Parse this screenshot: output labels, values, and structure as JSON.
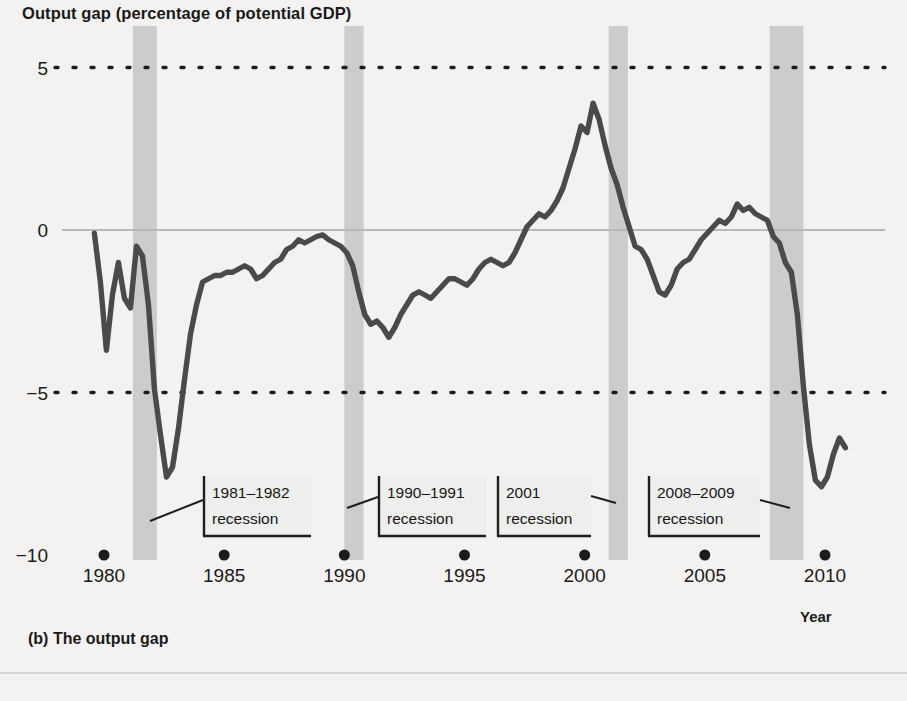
{
  "figure": {
    "title": "Output gap (percentage of potential GDP)",
    "caption": "(b) The output gap",
    "xaxis_label": "Year",
    "background_color": "#f3f2f0",
    "line_color": "#4a4a4a",
    "band_color": "#cccccc",
    "zero_line_color": "#b9b9b9",
    "grid_color": "#1b1b1b"
  },
  "chart_data": {
    "type": "line",
    "title": "Output gap (percentage of potential GDP)",
    "xlabel": "Year",
    "ylabel": "Output gap (percentage of potential GDP)",
    "xlim": [
      1979.4,
      2011.4
    ],
    "ylim": [
      -10,
      6.2
    ],
    "xticks": [
      1980,
      1985,
      1990,
      1995,
      2000,
      2005,
      2010
    ],
    "xtick_labels": [
      "1980",
      "1985",
      "1990",
      "1995",
      "2000",
      "2005",
      "2010"
    ],
    "yticks": [
      5,
      0,
      -5,
      -10
    ],
    "ytick_labels": [
      "5",
      "0",
      "−5",
      "−10"
    ],
    "grid": "dotted horizontal at 5 and -5; solid zero line at 0",
    "legend": "none",
    "series": [
      {
        "name": "Output gap",
        "color": "#4a4a4a",
        "x": [
          1979.6,
          1979.85,
          1980.1,
          1980.35,
          1980.6,
          1980.85,
          1981.1,
          1981.35,
          1981.6,
          1981.85,
          1982.1,
          1982.35,
          1982.6,
          1982.85,
          1983.1,
          1983.35,
          1983.6,
          1983.85,
          1984.1,
          1984.35,
          1984.6,
          1984.85,
          1985.1,
          1985.35,
          1985.6,
          1985.85,
          1986.1,
          1986.35,
          1986.6,
          1986.85,
          1987.1,
          1987.35,
          1987.6,
          1987.85,
          1988.1,
          1988.35,
          1988.6,
          1988.85,
          1989.1,
          1989.35,
          1989.6,
          1989.85,
          1990.1,
          1990.35,
          1990.6,
          1990.85,
          1991.1,
          1991.35,
          1991.6,
          1991.85,
          1992.1,
          1992.35,
          1992.6,
          1992.85,
          1993.1,
          1993.35,
          1993.6,
          1993.85,
          1994.1,
          1994.35,
          1994.6,
          1994.85,
          1995.1,
          1995.35,
          1995.6,
          1995.85,
          1996.1,
          1996.35,
          1996.6,
          1996.85,
          1997.1,
          1997.35,
          1997.6,
          1997.85,
          1998.1,
          1998.35,
          1998.6,
          1998.85,
          1999.1,
          1999.35,
          1999.6,
          1999.85,
          2000.1,
          2000.35,
          2000.6,
          2000.85,
          2001.1,
          2001.35,
          2001.6,
          2001.85,
          2002.1,
          2002.35,
          2002.6,
          2002.85,
          2003.1,
          2003.35,
          2003.6,
          2003.85,
          2004.1,
          2004.35,
          2004.6,
          2004.85,
          2005.1,
          2005.35,
          2005.6,
          2005.85,
          2006.1,
          2006.35,
          2006.6,
          2006.85,
          2007.1,
          2007.35,
          2007.6,
          2007.85,
          2008.1,
          2008.35,
          2008.6,
          2008.85,
          2009.1,
          2009.35,
          2009.6,
          2009.85,
          2010.1,
          2010.35,
          2010.6,
          2010.85
        ],
        "y": [
          -0.1,
          -1.6,
          -3.7,
          -2.0,
          -1.0,
          -2.1,
          -2.4,
          -0.5,
          -0.8,
          -2.3,
          -4.9,
          -6.3,
          -7.6,
          -7.3,
          -6.1,
          -4.6,
          -3.2,
          -2.3,
          -1.6,
          -1.5,
          -1.4,
          -1.4,
          -1.3,
          -1.3,
          -1.2,
          -1.1,
          -1.2,
          -1.5,
          -1.4,
          -1.2,
          -1.0,
          -0.9,
          -0.6,
          -0.5,
          -0.3,
          -0.4,
          -0.3,
          -0.2,
          -0.15,
          -0.3,
          -0.4,
          -0.5,
          -0.7,
          -1.1,
          -1.9,
          -2.6,
          -2.9,
          -2.8,
          -3.0,
          -3.3,
          -3.0,
          -2.6,
          -2.3,
          -2.0,
          -1.9,
          -2.0,
          -2.1,
          -1.9,
          -1.7,
          -1.5,
          -1.5,
          -1.6,
          -1.7,
          -1.5,
          -1.2,
          -1.0,
          -0.9,
          -1.0,
          -1.1,
          -1.0,
          -0.7,
          -0.3,
          0.1,
          0.3,
          0.5,
          0.4,
          0.6,
          0.9,
          1.3,
          1.9,
          2.5,
          3.2,
          3.0,
          3.9,
          3.4,
          2.6,
          1.9,
          1.4,
          0.7,
          0.1,
          -0.5,
          -0.6,
          -0.9,
          -1.4,
          -1.9,
          -2.0,
          -1.7,
          -1.2,
          -1.0,
          -0.9,
          -0.6,
          -0.3,
          -0.1,
          0.1,
          0.3,
          0.2,
          0.4,
          0.8,
          0.6,
          0.7,
          0.5,
          0.4,
          0.3,
          -0.2,
          -0.4,
          -1.0,
          -1.3,
          -2.6,
          -4.8,
          -6.6,
          -7.7,
          -7.9,
          -7.6,
          -6.9,
          -6.4,
          -6.7
        ]
      }
    ],
    "recession_bands": [
      {
        "label": "1981–1982 recession",
        "start": 1981.2,
        "end": 1982.2
      },
      {
        "label": "1990–1991 recession",
        "start": 1990.0,
        "end": 1990.8
      },
      {
        "label": "2001 recession",
        "start": 2001.0,
        "end": 2001.8
      },
      {
        "label": "2008–2009 recession",
        "start": 2007.7,
        "end": 2009.1
      }
    ],
    "annotations": [
      {
        "id": "a1",
        "line1": "1981–1982",
        "line2": "recession",
        "box_x": 203,
        "box_y": 476,
        "box_w": 108,
        "box_h": 60,
        "leader": [
          [
            150,
            521
          ],
          [
            203,
            500
          ]
        ]
      },
      {
        "id": "a2",
        "line1": "1990–1991",
        "line2": "recession",
        "box_x": 378,
        "box_y": 476,
        "box_w": 108,
        "box_h": 60,
        "leader": [
          [
            347,
            508
          ],
          [
            378,
            497
          ]
        ]
      },
      {
        "id": "a3",
        "line1": "2001",
        "line2": "recession",
        "box_x": 497,
        "box_y": 476,
        "box_w": 94,
        "box_h": 60,
        "leader": [
          [
            616,
            503
          ],
          [
            591,
            496
          ]
        ]
      },
      {
        "id": "a4",
        "line1": "2008–2009",
        "line2": "recession",
        "box_x": 648,
        "box_y": 476,
        "box_w": 112,
        "box_h": 60,
        "leader": [
          [
            790,
            508
          ],
          [
            760,
            500
          ]
        ]
      }
    ]
  }
}
